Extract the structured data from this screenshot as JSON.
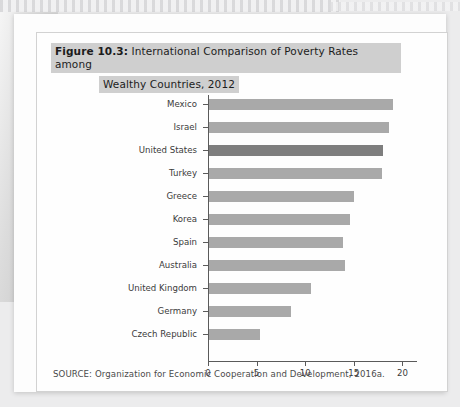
{
  "figure": {
    "number_label": "Figure 10.3:",
    "title_line1": "International Comparison of Poverty Rates among",
    "title_line2": "Wealthy Countries, 2012",
    "source": "SOURCE: Organization for Economic Cooperation and Development, 2016a."
  },
  "colors": {
    "bar": "#a9a9a9",
    "bar_highlight": "#7e7e7e",
    "axis": "#5a5a5a",
    "title_highlight": "#cfcfcf",
    "page": "#fefefe"
  },
  "chart_data": {
    "type": "bar",
    "orientation": "horizontal",
    "title": "Figure 10.3: International Comparison of Poverty Rates among Wealthy Countries, 2012",
    "xlabel": "",
    "ylabel": "",
    "xlim": [
      0,
      21.5
    ],
    "xticks": [
      0,
      5,
      10,
      15,
      20
    ],
    "xtick_labels": [
      "0",
      "5",
      "10",
      "15",
      "20"
    ],
    "grid": false,
    "legend": null,
    "highlight_category": "United States",
    "categories": [
      "Mexico",
      "Israel",
      "United States",
      "Turkey",
      "Greece",
      "Korea",
      "Spain",
      "Australia",
      "United Kingdom",
      "Germany",
      "Czech Republic"
    ],
    "values": [
      18.9,
      18.5,
      17.9,
      17.8,
      14.9,
      14.5,
      13.8,
      14.0,
      10.5,
      8.4,
      5.2
    ]
  }
}
